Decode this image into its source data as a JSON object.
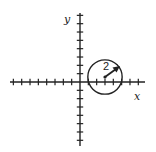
{
  "diagram": {
    "type": "coordinate-plane-with-circle",
    "axes": {
      "x_label": "x",
      "y_label": "y",
      "x_ticks_negative": 8,
      "x_ticks_positive": 7,
      "y_ticks_positive": 8,
      "y_ticks_negative": 7,
      "tick_spacing_px": 8.33
    },
    "circle": {
      "center": [
        3,
        0.6
      ],
      "radius": 2,
      "radius_label": "2"
    },
    "colors": {
      "stroke": "#222222",
      "background": "#ffffff"
    }
  }
}
